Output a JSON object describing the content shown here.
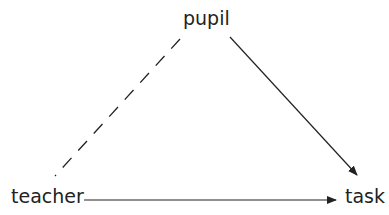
{
  "diagram": {
    "type": "triangle",
    "nodes": {
      "pupil": "pupil",
      "teacher": "teacher",
      "task": "task"
    },
    "edges": [
      {
        "from": "pupil",
        "to": "teacher",
        "style": "dashed",
        "arrow": false
      },
      {
        "from": "pupil",
        "to": "task",
        "style": "solid",
        "arrow": true
      },
      {
        "from": "teacher",
        "to": "task",
        "style": "solid",
        "arrow": true
      }
    ],
    "colors": {
      "line": "#222222",
      "text": "#222222",
      "background": "#ffffff"
    }
  }
}
